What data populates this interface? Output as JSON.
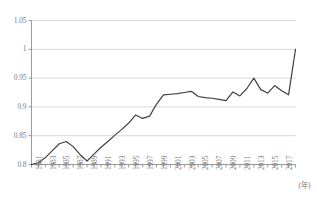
{
  "chart_data": {
    "type": "line",
    "title": "",
    "subtitle": "",
    "xlabel": "(年)",
    "ylabel": "",
    "xlim": [
      1981,
      2019
    ],
    "ylim": [
      0.8,
      1.05
    ],
    "yticks": [
      0.8,
      0.85,
      0.9,
      0.95,
      1,
      1.05
    ],
    "ytick_labels": [
      "0.8",
      "0.85",
      "0.9",
      "0.95",
      "1",
      "1.05"
    ],
    "grid": true,
    "legend": null,
    "legend_position": "none",
    "line_color": "#404040",
    "grid_color": "#d9d9d9",
    "axis_color": "#9a9a9a",
    "label_color": "#7d7d7d",
    "x": [
      1981,
      1982,
      1983,
      1984,
      1985,
      1986,
      1987,
      1988,
      1989,
      1990,
      1991,
      1992,
      1993,
      1994,
      1995,
      1996,
      1997,
      1998,
      1999,
      2000,
      2001,
      2002,
      2003,
      2004,
      2005,
      2006,
      2007,
      2008,
      2009,
      2010,
      2011,
      2012,
      2013,
      2014,
      2015,
      2016,
      2017,
      2018,
      2019
    ],
    "xtick_labels": [
      "1981",
      "1983",
      "1985",
      "1987",
      "1989",
      "1991",
      "1993",
      "1995",
      "1997",
      "1999",
      "2001",
      "2003",
      "2005",
      "2007",
      "2009",
      "2011",
      "2013",
      "2015",
      "2017"
    ],
    "xtick_values": [
      1981,
      1983,
      1985,
      1987,
      1989,
      1991,
      1993,
      1995,
      1997,
      1999,
      2001,
      2003,
      2005,
      2007,
      2009,
      2011,
      2013,
      2015,
      2017
    ],
    "values": [
      0.8,
      0.803,
      0.812,
      0.824,
      0.836,
      0.84,
      0.831,
      0.817,
      0.806,
      0.818,
      0.83,
      0.84,
      0.851,
      0.861,
      0.872,
      0.886,
      0.88,
      0.884,
      0.905,
      0.921,
      0.922,
      0.923,
      0.925,
      0.927,
      0.918,
      0.916,
      0.915,
      0.913,
      0.911,
      0.926,
      0.919,
      0.932,
      0.95,
      0.93,
      0.924,
      0.937,
      0.928,
      0.921,
      1.0
    ],
    "series": [
      {
        "name": "",
        "values": [
          0.8,
          0.803,
          0.812,
          0.824,
          0.836,
          0.84,
          0.831,
          0.817,
          0.806,
          0.818,
          0.83,
          0.84,
          0.851,
          0.861,
          0.872,
          0.886,
          0.88,
          0.884,
          0.905,
          0.921,
          0.922,
          0.923,
          0.925,
          0.927,
          0.918,
          0.916,
          0.915,
          0.913,
          0.911,
          0.926,
          0.919,
          0.932,
          0.95,
          0.93,
          0.924,
          0.937,
          0.928,
          0.921,
          1.0
        ]
      }
    ],
    "points": [
      {
        "x": 1981,
        "y": 0.8
      },
      {
        "x": 1982,
        "y": 0.803
      },
      {
        "x": 1983,
        "y": 0.812
      },
      {
        "x": 1984,
        "y": 0.824
      },
      {
        "x": 1985,
        "y": 0.836
      },
      {
        "x": 1986,
        "y": 0.84
      },
      {
        "x": 1987,
        "y": 0.831
      },
      {
        "x": 1988,
        "y": 0.817
      },
      {
        "x": 1989,
        "y": 0.806
      },
      {
        "x": 1990,
        "y": 0.818
      },
      {
        "x": 1991,
        "y": 0.83
      },
      {
        "x": 1992,
        "y": 0.84
      },
      {
        "x": 1993,
        "y": 0.851
      },
      {
        "x": 1994,
        "y": 0.861
      },
      {
        "x": 1995,
        "y": 0.872
      },
      {
        "x": 1996,
        "y": 0.886
      },
      {
        "x": 1997,
        "y": 0.88
      },
      {
        "x": 1998,
        "y": 0.884
      },
      {
        "x": 1999,
        "y": 0.905
      },
      {
        "x": 2000,
        "y": 0.921
      },
      {
        "x": 2001,
        "y": 0.922
      },
      {
        "x": 2002,
        "y": 0.923
      },
      {
        "x": 2003,
        "y": 0.925
      },
      {
        "x": 2004,
        "y": 0.927
      },
      {
        "x": 2005,
        "y": 0.918
      },
      {
        "x": 2006,
        "y": 0.916
      },
      {
        "x": 2007,
        "y": 0.915
      },
      {
        "x": 2008,
        "y": 0.913
      },
      {
        "x": 2009,
        "y": 0.911
      },
      {
        "x": 2010,
        "y": 0.926
      },
      {
        "x": 2011,
        "y": 0.919
      },
      {
        "x": 2012,
        "y": 0.932
      },
      {
        "x": 2013,
        "y": 0.95
      },
      {
        "x": 2014,
        "y": 0.93
      },
      {
        "x": 2015,
        "y": 0.924
      },
      {
        "x": 2016,
        "y": 0.937
      },
      {
        "x": 2017,
        "y": 0.928
      },
      {
        "x": 2018,
        "y": 0.921
      },
      {
        "x": 2019,
        "y": 1.0
      }
    ]
  }
}
